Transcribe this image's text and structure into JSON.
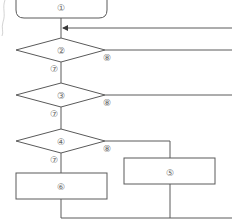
{
  "diagram": {
    "type": "flowchart",
    "colors": {
      "stroke": "#5a5a5a",
      "label": "#666666",
      "background": "#ffffff"
    },
    "nodes": {
      "n1": {
        "label": "①",
        "shape": "terminal"
      },
      "n2": {
        "label": "②",
        "shape": "decision"
      },
      "n3": {
        "label": "③",
        "shape": "decision"
      },
      "n4": {
        "label": "④",
        "shape": "decision"
      },
      "n5": {
        "label": "⑤",
        "shape": "process"
      },
      "n6": {
        "label": "⑥",
        "shape": "process"
      }
    },
    "edge_labels": {
      "n2_yes": "⑦",
      "n2_no": "⑧",
      "n3_yes": "⑦",
      "n3_no": "⑧",
      "n4_yes": "⑦",
      "n4_no": "⑧"
    }
  }
}
